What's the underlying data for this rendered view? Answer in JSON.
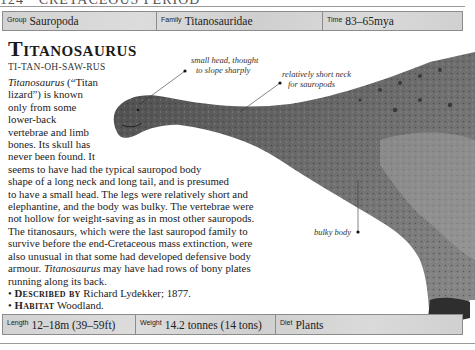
{
  "page": {
    "running_head": "124 · CRETACEOUS PERIOD"
  },
  "top_bar": {
    "group": {
      "label": "Group",
      "value": "Sauropoda"
    },
    "family": {
      "label": "Family",
      "value": "Titanosauridae"
    },
    "time": {
      "label": "Time",
      "value": "83–65mya"
    }
  },
  "entry": {
    "title": "Titanosaurus",
    "pronunciation": "TI-TAN-OH-SAW-RUS",
    "lines": [
      {
        "pre_italic": "",
        "italic": "Titanosaurus",
        "post": " (“Titan"
      },
      {
        "text": "lizard”) is known"
      },
      {
        "text": "only from some"
      },
      {
        "text": "lower-back"
      },
      {
        "text": "vertebrae and limb"
      },
      {
        "text": "bones. Its skull has"
      },
      {
        "text": "never been found. It"
      },
      {
        "text": "seems to have had the typical sauropod body"
      },
      {
        "text": "shape of a long neck and long tail, and is presumed"
      },
      {
        "text": "to have a small head. The legs were relatively short and"
      },
      {
        "text": "elephantine, and the body was bulky. The vertebrae were"
      },
      {
        "text": "not hollow for weight-saving as in most other sauropods."
      },
      {
        "text": "The titanosaurs, which were the last sauropod family to"
      },
      {
        "text": "survive before the end-Cretaceous mass extinction, were"
      },
      {
        "text": "also unusual in that some had developed defensive body"
      },
      {
        "pre_italic": "armour. ",
        "italic": "Titanosaurus",
        "post": " may have had rows of bony plates"
      },
      {
        "text": "running along its back."
      }
    ],
    "described_by": {
      "label": "Described by",
      "value": "Richard Lydekker; 1877."
    },
    "habitat": {
      "label": "Habitat",
      "value": "Woodland."
    }
  },
  "annotations": {
    "head": [
      "small head, thought",
      "to slope sharply"
    ],
    "neck": [
      "relatively short neck",
      "for sauropods"
    ],
    "body": [
      "bulky body"
    ]
  },
  "bottom_bar": {
    "length": {
      "label": "Length",
      "value": "12–18m (39–59ft)"
    },
    "weight": {
      "label": "Weight",
      "value": "14.2 tonnes (14 tons)"
    },
    "diet": {
      "label": "Diet",
      "value": "Plants"
    }
  },
  "colors": {
    "bar_bg": "#d4d4d4",
    "border": "#8c8c8c",
    "dino_dark": "#3a3a3a",
    "dino_mid": "#6a6a6a",
    "dino_light": "#9a9a9a"
  }
}
